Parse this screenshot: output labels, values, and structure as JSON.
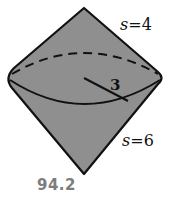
{
  "figure": {
    "upper_cone": {
      "slant_label": "s",
      "slant_value": "4",
      "slant_text": "s=4"
    },
    "lower_cone": {
      "slant_label": "s",
      "slant_value": "6",
      "slant_text": "s=6"
    },
    "radius_label": "3",
    "colors": {
      "fill": "#8f8f8f",
      "stroke": "#111111",
      "caption": "#7d7d7d"
    }
  },
  "caption": "94.2"
}
